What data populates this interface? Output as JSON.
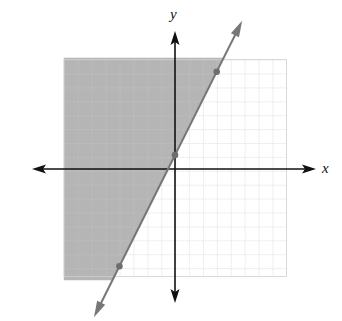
{
  "chart_data": {
    "type": "line",
    "title": "",
    "xlabel": "x",
    "ylabel": "y",
    "xlim": [
      -8,
      8
    ],
    "ylim": [
      -8,
      8
    ],
    "grid": true,
    "grid_step": 1,
    "axis_ticks_labeled": false,
    "series": [
      {
        "name": "boundary line y = 2x + 1",
        "style": "solid",
        "color": "#777777",
        "x": [
          -4,
          0,
          3
        ],
        "y": [
          -7,
          1,
          7
        ],
        "marked_points": [
          [
            -4,
            -7
          ],
          [
            0,
            1
          ],
          [
            3,
            7
          ]
        ]
      }
    ],
    "shaded_region": {
      "description": "half-plane above/left of line",
      "inequality": "y >= 2x + 1",
      "color": "#b5b5b5"
    },
    "annotations": []
  },
  "axes": {
    "x_label": "x",
    "y_label": "y"
  }
}
